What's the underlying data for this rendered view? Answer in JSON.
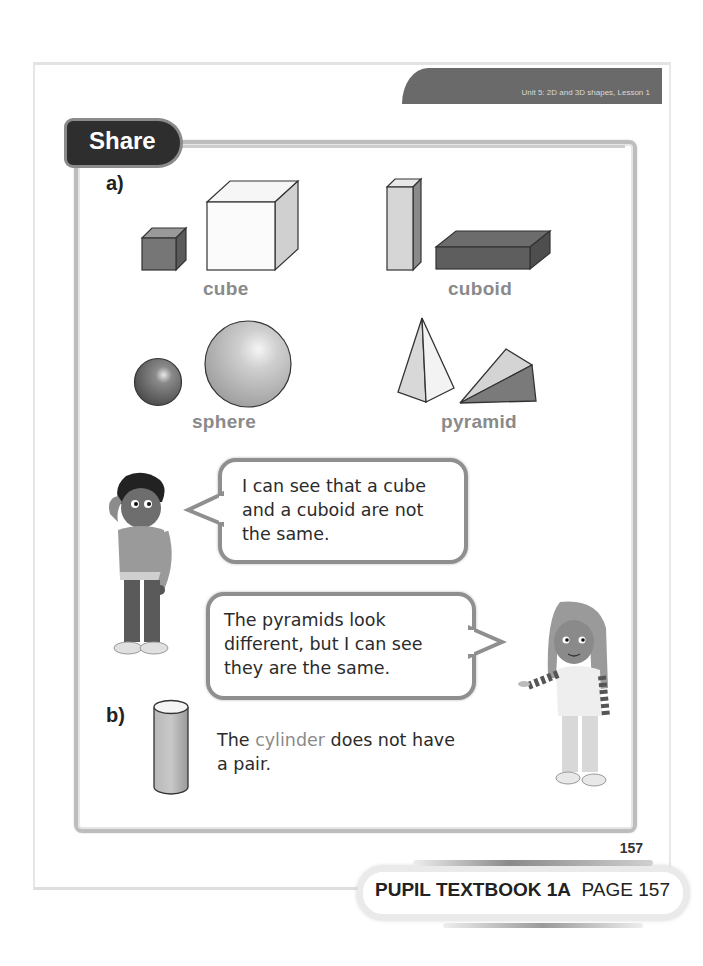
{
  "header": {
    "unit_lesson": "Unit 5: 2D and 3D shapes, Lesson 1"
  },
  "section": {
    "title": "Share"
  },
  "part_a": {
    "label": "a)",
    "shapes": [
      {
        "name": "cube",
        "label": "cube"
      },
      {
        "name": "cuboid",
        "label": "cuboid"
      },
      {
        "name": "sphere",
        "label": "sphere"
      },
      {
        "name": "pyramid",
        "label": "pyramid"
      }
    ],
    "bubbles": [
      {
        "speaker": "boy",
        "text": "I can see that a cube and a cuboid are not the same.",
        "lines": [
          "I can see that a cube",
          "and a cuboid are not",
          "the same."
        ]
      },
      {
        "speaker": "girl",
        "text": "The pyramids look different, but I can see they are the same.",
        "lines": [
          "The pyramids look",
          "different, but I can see",
          "they are the same."
        ]
      }
    ]
  },
  "part_b": {
    "label": "b)",
    "shape": "cylinder",
    "text_before": "The ",
    "highlight": "cylinder",
    "text_after": " does not have",
    "line2": "a pair."
  },
  "page_number": "157",
  "footer": {
    "book": "PUPIL TEXTBOOK 1A",
    "page": "PAGE 157"
  },
  "colors": {
    "tab_dark": "#2e2e2e",
    "header_tab": "#6a6a6a",
    "label_grey": "#8a8a8a",
    "frame": "#bdbdbd"
  }
}
